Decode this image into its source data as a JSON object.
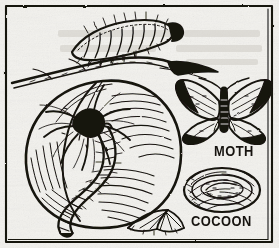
{
  "figure": {
    "kind": "engraving",
    "medium": "vintage newspaper line engraving",
    "background_color": "#f2f1ed",
    "ink_color": "#16130f",
    "border": {
      "style": "thin double rule frame",
      "color": "#2b2722"
    }
  },
  "labels": {
    "moth": "MOTH",
    "cocoon": "COCOON"
  },
  "elements": [
    {
      "name": "caterpillar-on-twig",
      "label": "",
      "position": "top-center",
      "description": "segmented bristly larva crawling along a slender twig"
    },
    {
      "name": "twig",
      "label": "",
      "position": "upper-left-to-right",
      "description": "branch spanning the upper portion with a dark tapering tip at right"
    },
    {
      "name": "fruit",
      "label": "",
      "position": "center-left",
      "description": "large round apple with hatched shading and dark blossom-end calyx"
    },
    {
      "name": "caterpillar-on-fruit",
      "label": "",
      "position": "center",
      "description": "second larva curving down across the face of the fruit"
    },
    {
      "name": "leaf",
      "label": "",
      "position": "bottom-center",
      "description": "pointed serrated leaf below the fruit"
    },
    {
      "name": "moth",
      "label": "MOTH",
      "position": "right-upper",
      "description": "adult moth with spread wings, dark wing tips and paired antennae"
    },
    {
      "name": "cocoon",
      "label": "COCOON",
      "position": "right-lower",
      "description": "oval silken cocoon with concentric spiral texture"
    }
  ]
}
